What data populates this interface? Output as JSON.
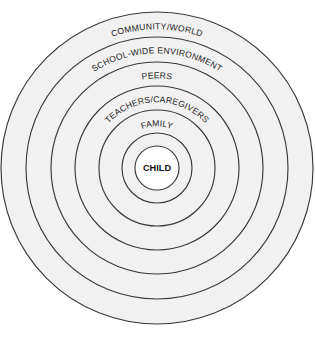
{
  "diagram": {
    "background_color": "#ffffff",
    "stroke_color": "#3a3a3a",
    "ring_fill_color": "#f1f1f1",
    "center_fill_color": "#ffffff",
    "center": {
      "x": 157,
      "y": 168
    },
    "rings": [
      {
        "id": "community-world",
        "label": "COMMUNITY/WORLD",
        "radius": 156,
        "label_radius": 141,
        "font_size": 8.6,
        "fill": "#f1f1f1",
        "curved": true
      },
      {
        "id": "school-wide-environment",
        "label": "SCHOOL-WIDE ENVIRONMENT",
        "radius": 131,
        "label_radius": 117,
        "font_size": 8.6,
        "fill": "#f1f1f1",
        "curved": true
      },
      {
        "id": "peers",
        "label": "PEERS",
        "radius": 106,
        "label_radius": 92,
        "font_size": 8.6,
        "fill": "#f1f1f1",
        "curved": true
      },
      {
        "id": "teachers-caregivers",
        "label": "TEACHERS/CAREGIVERS",
        "radius": 82,
        "label_radius": 68,
        "font_size": 8.6,
        "fill": "#f1f1f1",
        "curved": true
      },
      {
        "id": "family",
        "label": "FAMILY",
        "radius": 58,
        "label_radius": 44,
        "font_size": 8.6,
        "fill": "#f1f1f1",
        "curved": true
      },
      {
        "id": "inner-blank",
        "label": "",
        "radius": 35,
        "label_radius": 0,
        "font_size": 0,
        "fill": "#f1f1f1",
        "curved": false
      },
      {
        "id": "child",
        "label": "CHILD",
        "radius": 22,
        "label_radius": 0,
        "font_size": 9.2,
        "fill": "#ffffff",
        "curved": false
      }
    ]
  }
}
